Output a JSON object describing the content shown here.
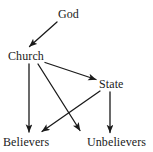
{
  "diagram": {
    "background_color": "#ffffff",
    "stroke_color": "#1a1a1a",
    "text_color": "#1a1a1a",
    "nodes": [
      {
        "id": "god",
        "label": "God"
      },
      {
        "id": "church",
        "label": "Church"
      },
      {
        "id": "state",
        "label": "State"
      },
      {
        "id": "believers",
        "label": "Believers"
      },
      {
        "id": "unbelievers",
        "label": "Unbelievers"
      }
    ],
    "edges": [
      {
        "id": "god-to-church",
        "from": "God",
        "to": "Church",
        "shape": "diagonal-down-left"
      },
      {
        "id": "church-to-state",
        "from": "Church",
        "to": "State",
        "shape": "diagonal-down-right"
      },
      {
        "id": "church-to-believers",
        "from": "Church",
        "to": "Believers",
        "shape": "vertical-down"
      },
      {
        "id": "church-to-unbelievers",
        "from": "Church",
        "to": "Unbelievers",
        "shape": "diagonal-down-right"
      },
      {
        "id": "state-to-believers",
        "from": "State",
        "to": "Believers",
        "shape": "diagonal-down-left"
      },
      {
        "id": "state-to-unbelievers",
        "from": "State",
        "to": "Unbelievers",
        "shape": "vertical-down"
      }
    ]
  }
}
